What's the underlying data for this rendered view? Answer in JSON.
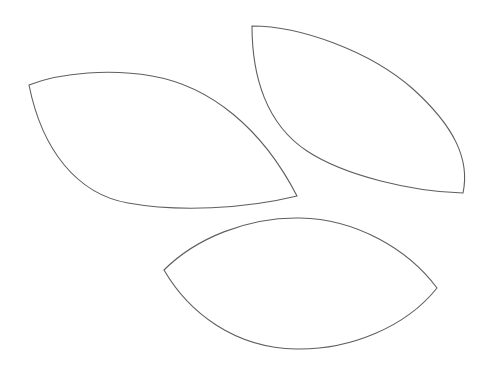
{
  "document": {
    "title": "Leaf Template Outlines",
    "kind": "line-art-diagram",
    "description": "Three leaf (pointed oval / vesica) outline shapes on a plain white background",
    "background_color": "#ffffff",
    "stroke_color": "#5f5f5f",
    "stroke_width": 1.1,
    "fill_color": "#ffffff",
    "canvas": {
      "width": 490,
      "height": 372,
      "units": "px"
    },
    "shape_count": 3
  },
  "shapes": [
    {
      "id": "leaf-upper-left",
      "label": "Upper left leaf",
      "orientation": "tilted down-right",
      "tip_start": {
        "x": 29,
        "y": 85
      },
      "tip_end": {
        "x": 297,
        "y": 196
      },
      "path": "M 29 85 C 62 72 112 69 152 76 C 210 86 262 128 297 196 C 244 209 178 212 128 203 C 77 194 42 150 29 85 Z"
    },
    {
      "id": "leaf-upper-right",
      "label": "Upper right leaf",
      "orientation": "tilted down-right, steep",
      "tip_start": {
        "x": 252,
        "y": 26
      },
      "tip_end": {
        "x": 463,
        "y": 193
      },
      "path": "M 252 26 C 300 26 370 51 413 89 C 455 127 470 160 463 193 C 414 192 345 176 307 151 C 266 124 252 76 252 26 Z"
    },
    {
      "id": "leaf-bottom",
      "label": "Bottom leaf",
      "orientation": "horizontal",
      "tip_start": {
        "x": 164,
        "y": 270
      },
      "tip_end": {
        "x": 437,
        "y": 288
      },
      "path": "M 164 270 C 196 238 248 217 300 218 C 356 219 408 249 437 288 C 406 327 350 350 296 349 C 235 348 189 313 164 270 Z"
    }
  ]
}
